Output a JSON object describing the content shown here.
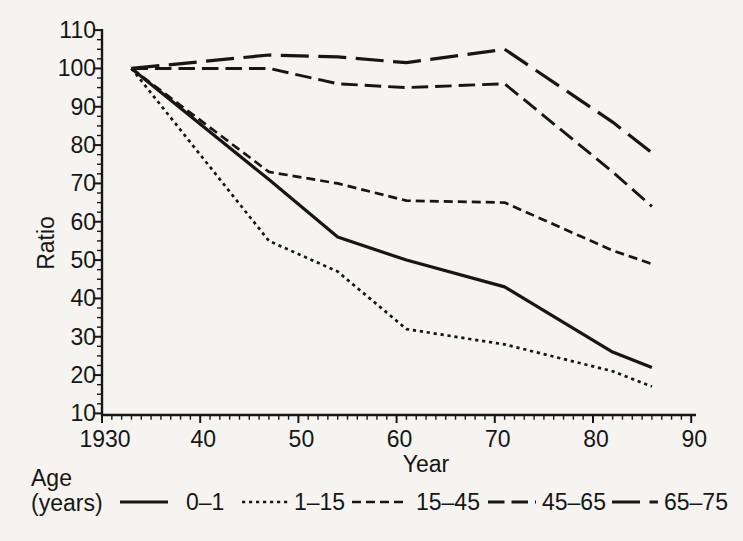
{
  "paper_color": "#f5f4f1",
  "ink_color": "#161616",
  "chart_data": {
    "type": "line",
    "title": "",
    "xlabel": "Year",
    "ylabel": "Ratio",
    "xlim": [
      1930,
      1990
    ],
    "ylim": [
      10,
      110
    ],
    "grid": false,
    "legend_position": "bottom",
    "x_tick_years": [
      1930,
      1940,
      1950,
      1960,
      1970,
      1980,
      1990
    ],
    "x_tick_labels": [
      "1930",
      "40",
      "50",
      "60",
      "70",
      "80",
      "90"
    ],
    "y_tick_values": [
      110,
      100,
      90,
      80,
      70,
      60,
      50,
      40,
      30,
      20,
      10
    ],
    "y_tick_labels": [
      "110",
      "100",
      "90",
      "80",
      "70",
      "60",
      "50",
      "40",
      "30",
      "20",
      "10"
    ],
    "x": [
      1933,
      1947,
      1954,
      1961,
      1971,
      1982,
      1986
    ],
    "series": [
      {
        "name": "0–1",
        "line_style": "solid",
        "values": [
          100,
          71,
          56,
          50,
          43,
          26,
          22
        ]
      },
      {
        "name": "1–15",
        "line_style": "dotted",
        "values": [
          100,
          55,
          47,
          32,
          28,
          21,
          17
        ]
      },
      {
        "name": "15–45",
        "line_style": "dashed",
        "values": [
          100,
          73,
          70,
          65.5,
          65,
          52.5,
          49
        ]
      },
      {
        "name": "45–65",
        "line_style": "long-dash",
        "values": [
          100,
          100,
          96,
          95,
          96,
          73,
          64
        ]
      },
      {
        "name": "65–75",
        "line_style": "extra-long-dash",
        "values": [
          100,
          103.5,
          103,
          101.5,
          105,
          86,
          78
        ]
      }
    ],
    "legend": {
      "title_line1": "Age",
      "title_line2": "(years)",
      "entries": [
        "0–1",
        "1–15",
        "15–45",
        "45–65",
        "65–75"
      ]
    }
  }
}
